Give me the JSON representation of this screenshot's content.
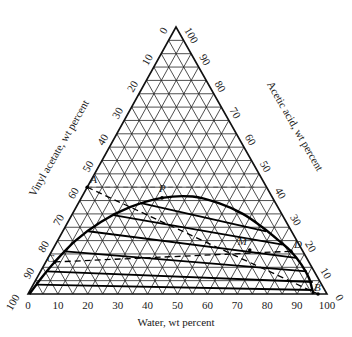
{
  "chart_data": {
    "type": "ternary",
    "title": "",
    "axes": {
      "bottom": {
        "label": "Water, wt percent",
        "ticks": [
          0,
          10,
          20,
          30,
          40,
          50,
          60,
          70,
          80,
          90,
          100
        ]
      },
      "left": {
        "label": "Vinyl acetate, wt percent",
        "ticks": [
          100,
          90,
          80,
          70,
          60,
          50,
          40,
          30,
          20,
          10,
          0
        ]
      },
      "right": {
        "label": "Acetic acid, wt percent",
        "ticks": [
          0,
          10,
          20,
          30,
          40,
          50,
          60,
          70,
          80,
          90,
          100
        ]
      }
    },
    "vertices": {
      "bottom_left": "100% Vinyl acetate",
      "bottom_right": "100% Water",
      "top": "100% Acetic acid"
    },
    "grid": {
      "step": 5,
      "major_step": 10
    },
    "binodal_curve": [
      {
        "water": 0.5,
        "acid": 0
      },
      {
        "water": 1.5,
        "acid": 6
      },
      {
        "water": 3,
        "acid": 12
      },
      {
        "water": 6,
        "acid": 20
      },
      {
        "water": 11,
        "acid": 27
      },
      {
        "water": 18,
        "acid": 32.5
      },
      {
        "water": 27,
        "acid": 36
      },
      {
        "water": 37,
        "acid": 36.5
      },
      {
        "water": 47,
        "acid": 34
      },
      {
        "water": 57,
        "acid": 30
      },
      {
        "water": 66,
        "acid": 25
      },
      {
        "water": 74,
        "acid": 20
      },
      {
        "water": 80,
        "acid": 16
      },
      {
        "water": 86,
        "acid": 11
      },
      {
        "water": 91,
        "acid": 6
      },
      {
        "water": 94,
        "acid": 2
      },
      {
        "water": 95.5,
        "acid": 0
      }
    ],
    "tie_lines": [
      {
        "from": {
          "water": 1.0,
          "acid": 3.5
        },
        "to": {
          "water": 94.5,
          "acid": 1.5
        }
      },
      {
        "from": {
          "water": 2.0,
          "acid": 8.5
        },
        "to": {
          "water": 93,
          "acid": 4.5
        }
      },
      {
        "from": {
          "water": 4.5,
          "acid": 16
        },
        "to": {
          "water": 89,
          "acid": 8.5
        }
      },
      {
        "from": {
          "water": 8.5,
          "acid": 23.5
        },
        "to": {
          "water": 83,
          "acid": 13.5
        }
      },
      {
        "from": {
          "water": 14,
          "acid": 29.5
        },
        "to": {
          "water": 76,
          "acid": 18.5
        }
      },
      {
        "from": {
          "water": 21,
          "acid": 34
        },
        "to": {
          "water": 68,
          "acid": 23.5
        }
      }
    ],
    "points": [
      {
        "label": "A",
        "water": 0,
        "acid": 40
      },
      {
        "label": "P",
        "water": 27,
        "acid": 36
      },
      {
        "label": "M",
        "water": 66,
        "acid": 16.5
      },
      {
        "label": "D",
        "water": 80,
        "acid": 16
      },
      {
        "label": "C",
        "water": 3,
        "acid": 12
      },
      {
        "label": "B",
        "water": 97,
        "acid": 0
      }
    ],
    "dashed_lines": [
      {
        "from": "A",
        "to": "B",
        "description": "feed line A to solvent B"
      },
      {
        "from": "C",
        "to": "D",
        "description": "line C to D passing M"
      }
    ]
  }
}
